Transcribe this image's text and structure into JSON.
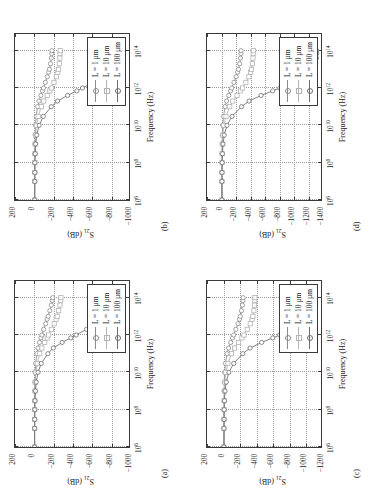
{
  "figure": {
    "rotation_note": "figure rendered rotated 90 degrees counter-clockwise",
    "xlabel": "Frequency (Hz)",
    "ylabel_html": "S21 (dB)",
    "ylabel_main": "S",
    "ylabel_sub": "21",
    "ylabel_unit": " (dB)",
    "legend_labels": [
      "L = 1 µm",
      "L = 10 µm",
      "L = 100 µm"
    ],
    "series_colors": [
      "#8c8c8c",
      "#b4b4b4",
      "#6e6e6e"
    ],
    "xticks": [
      "10⁶",
      "10⁸",
      "10¹⁰",
      "10¹²",
      "10¹⁴"
    ],
    "xtick_bases": [
      "10",
      "10",
      "10",
      "10",
      "10"
    ],
    "xtick_exps": [
      "6",
      "8",
      "10",
      "12",
      "14"
    ]
  },
  "chart_data": [
    {
      "id": "a",
      "panel_label": "(a)",
      "type": "line",
      "title": "",
      "xlabel": "Frequency (Hz)",
      "ylabel": "S21 (dB)",
      "xscale": "log",
      "xlim": [
        1000000,
        1000000000000000
      ],
      "ylim": [
        -1000,
        200
      ],
      "yticks": [
        200,
        0,
        -200,
        -400,
        -600,
        -800,
        -1000
      ],
      "xticks": [
        1000000,
        100000000,
        10000000000,
        1000000000000,
        100000000000000
      ],
      "grid": true,
      "legend_position": "inside-bottom-right",
      "x": [
        1000000.0,
        10000000.0,
        30000000.0,
        100000000.0,
        300000000.0,
        1000000000.0,
        3000000000.0,
        10000000000.0,
        30000000000.0,
        100000000000.0,
        200000000000.0,
        400000000000.0,
        700000000000.0,
        1000000000000.0,
        2000000000000.0,
        4000000000000.0,
        7000000000000.0,
        10000000000000.0,
        20000000000000.0,
        40000000000000.0,
        70000000000000.0,
        100000000000000.0
      ],
      "series": [
        {
          "name": "L = 1 µm",
          "values": [
            -3,
            -3,
            -3,
            -4,
            -4,
            -5,
            -6,
            -9,
            -14,
            -26,
            -38,
            -54,
            -68,
            -78,
            -96,
            -117,
            -133,
            -143,
            -160,
            -176,
            -186,
            -190
          ]
        },
        {
          "name": "L = 10 µm",
          "values": [
            -3,
            -3,
            -3,
            -4,
            -5,
            -6,
            -9,
            -16,
            -30,
            -56,
            -78,
            -108,
            -133,
            -148,
            -176,
            -205,
            -225,
            -236,
            -252,
            -265,
            -272,
            -275
          ]
        },
        {
          "name": "L = 100 µm",
          "values": [
            -3,
            -3,
            -4,
            -5,
            -7,
            -11,
            -19,
            -38,
            -72,
            -140,
            -196,
            -288,
            -378,
            -432,
            -540,
            -648,
            -716,
            -752,
            -790,
            -812,
            -820,
            -822
          ]
        }
      ]
    },
    {
      "id": "b",
      "panel_label": "(b)",
      "type": "line",
      "title": "",
      "xlabel": "Frequency (Hz)",
      "ylabel": "S21 (dB)",
      "xscale": "log",
      "xlim": [
        1000000,
        1000000000000000
      ],
      "ylim": [
        -1000,
        200
      ],
      "yticks": [
        200,
        0,
        -200,
        -400,
        -600,
        -800,
        -1000
      ],
      "xticks": [
        1000000,
        100000000,
        10000000000,
        1000000000000,
        100000000000000
      ],
      "grid": true,
      "legend_position": "inside-bottom-right",
      "x": [
        1000000.0,
        10000000.0,
        30000000.0,
        100000000.0,
        300000000.0,
        1000000000.0,
        3000000000.0,
        10000000000.0,
        30000000000.0,
        100000000000.0,
        200000000000.0,
        400000000000.0,
        700000000000.0,
        1000000000000.0,
        2000000000000.0,
        4000000000000.0,
        7000000000000.0,
        10000000000000.0,
        20000000000000.0,
        40000000000000.0,
        70000000000000.0,
        100000000000000.0
      ],
      "series": [
        {
          "name": "L = 1 µm",
          "values": [
            -4,
            -4,
            -4,
            -5,
            -5,
            -6,
            -8,
            -12,
            -19,
            -34,
            -48,
            -68,
            -84,
            -95,
            -114,
            -134,
            -148,
            -156,
            -167,
            -176,
            -180,
            -182
          ]
        },
        {
          "name": "L = 10 µm",
          "values": [
            -4,
            -4,
            -5,
            -5,
            -6,
            -8,
            -12,
            -22,
            -40,
            -72,
            -98,
            -133,
            -160,
            -176,
            -203,
            -228,
            -243,
            -250,
            -258,
            -264,
            -266,
            -267
          ]
        },
        {
          "name": "L = 100 µm",
          "values": [
            -4,
            -5,
            -5,
            -6,
            -9,
            -14,
            -25,
            -50,
            -93,
            -175,
            -240,
            -344,
            -440,
            -498,
            -608,
            -715,
            -778,
            -810,
            -843,
            -862,
            -869,
            -871
          ]
        }
      ]
    },
    {
      "id": "c",
      "panel_label": "(c)",
      "type": "line",
      "title": "",
      "xlabel": "Frequency (Hz)",
      "ylabel": "S21 (dB)",
      "xscale": "log",
      "xlim": [
        1000000,
        1000000000000000
      ],
      "ylim": [
        -1200,
        200
      ],
      "yticks": [
        200,
        0,
        -200,
        -400,
        -600,
        -800,
        -1000,
        -1200
      ],
      "xticks": [
        1000000,
        100000000,
        10000000000,
        1000000000000,
        100000000000000
      ],
      "grid": true,
      "legend_position": "inside-bottom-right",
      "x": [
        1000000.0,
        10000000.0,
        30000000.0,
        100000000.0,
        300000000.0,
        1000000000.0,
        3000000000.0,
        10000000000.0,
        30000000000.0,
        100000000000.0,
        200000000000.0,
        400000000000.0,
        700000000000.0,
        1000000000000.0,
        2000000000000.0,
        4000000000000.0,
        7000000000000.0,
        10000000000000.0,
        20000000000000.0,
        40000000000000.0,
        70000000000000.0,
        100000000000000.0
      ],
      "series": [
        {
          "name": "L = 1 µm",
          "values": [
            -4,
            -4,
            -4,
            -5,
            -6,
            -7,
            -9,
            -14,
            -23,
            -42,
            -60,
            -86,
            -108,
            -122,
            -148,
            -174,
            -192,
            -202,
            -216,
            -228,
            -234,
            -236
          ]
        },
        {
          "name": "L = 10 µm",
          "values": [
            -4,
            -4,
            -5,
            -6,
            -7,
            -10,
            -15,
            -28,
            -52,
            -96,
            -132,
            -182,
            -222,
            -246,
            -286,
            -322,
            -344,
            -354,
            -366,
            -374,
            -377,
            -378
          ]
        },
        {
          "name": "L = 100 µm",
          "values": [
            -4,
            -5,
            -6,
            -7,
            -11,
            -18,
            -32,
            -64,
            -122,
            -232,
            -320,
            -460,
            -594,
            -676,
            -830,
            -968,
            -1040,
            -1070,
            -1093,
            -1103,
            -1106,
            -1107
          ]
        }
      ]
    },
    {
      "id": "d",
      "panel_label": "(d)",
      "type": "line",
      "title": "",
      "xlabel": "Frequency (Hz)",
      "ylabel": "S21 (dB)",
      "xscale": "log",
      "xlim": [
        1000000,
        1000000000000000
      ],
      "ylim": [
        -1400,
        200
      ],
      "yticks": [
        200,
        0,
        -200,
        -400,
        -600,
        -800,
        -1000,
        -1200,
        -1400
      ],
      "xticks": [
        1000000,
        100000000,
        10000000000,
        1000000000000,
        100000000000000
      ],
      "grid": true,
      "legend_position": "inside-bottom-right",
      "x": [
        1000000.0,
        10000000.0,
        30000000.0,
        100000000.0,
        300000000.0,
        1000000000.0,
        3000000000.0,
        10000000000.0,
        30000000000.0,
        100000000000.0,
        200000000000.0,
        400000000000.0,
        700000000000.0,
        1000000000000.0,
        2000000000000.0,
        4000000000000.0,
        7000000000000.0,
        10000000000000.0,
        20000000000000.0,
        40000000000000.0,
        70000000000000.0,
        100000000000000.0
      ],
      "series": [
        {
          "name": "L = 1 µm",
          "values": [
            -5,
            -5,
            -5,
            -6,
            -7,
            -8,
            -11,
            -17,
            -28,
            -50,
            -70,
            -100,
            -125,
            -142,
            -172,
            -202,
            -222,
            -234,
            -250,
            -262,
            -268,
            -270
          ]
        },
        {
          "name": "L = 10 µm",
          "values": [
            -5,
            -5,
            -6,
            -7,
            -8,
            -11,
            -18,
            -33,
            -62,
            -114,
            -156,
            -214,
            -262,
            -290,
            -336,
            -378,
            -402,
            -414,
            -426,
            -434,
            -437,
            -438
          ]
        },
        {
          "name": "L = 100 µm",
          "values": [
            -5,
            -6,
            -7,
            -9,
            -13,
            -21,
            -38,
            -76,
            -145,
            -276,
            -380,
            -546,
            -706,
            -804,
            -988,
            -1150,
            -1236,
            -1272,
            -1298,
            -1310,
            -1314,
            -1315
          ]
        }
      ]
    }
  ]
}
